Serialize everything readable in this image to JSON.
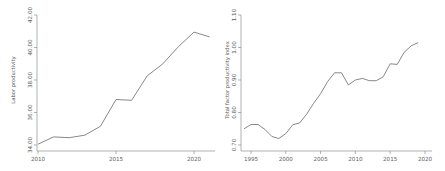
{
  "figure": {
    "background": "#ffffff"
  },
  "chart_data": [
    {
      "type": "line",
      "title": "",
      "xlabel": "",
      "ylabel": "Labor productivity",
      "x": [
        2010,
        2011,
        2012,
        2013,
        2014,
        2015,
        2016,
        2017,
        2018,
        2019,
        2020,
        2021
      ],
      "values": [
        34.05,
        34.5,
        34.45,
        34.6,
        35.15,
        36.8,
        36.75,
        38.25,
        39.0,
        40.05,
        40.95,
        40.65
      ],
      "ytick_values": [
        34,
        36,
        38,
        40,
        42
      ],
      "ytick_labels": [
        "34.00",
        "36.00",
        "38.00",
        "40.00",
        "42.00"
      ],
      "xtick_values": [
        2010,
        2015,
        2020
      ],
      "xtick_labels": [
        "2010",
        "2015",
        "2020"
      ],
      "ylim": [
        33.6,
        42.0
      ],
      "xlim": [
        2010,
        2021.4
      ],
      "grid": false,
      "legend": "none",
      "line_color": "#6a6a6a",
      "axis_color": "#8f8f8f",
      "text_color": "#5e5e5e"
    },
    {
      "type": "line",
      "title": "",
      "xlabel": "",
      "ylabel": "Total factor productivity index",
      "x": [
        1994,
        1995,
        1996,
        1997,
        1998,
        1999,
        2000,
        2001,
        2002,
        2003,
        2004,
        2005,
        2006,
        2007,
        2008,
        2009,
        2010,
        2011,
        2012,
        2013,
        2014,
        2015,
        2016,
        2017,
        2018,
        2019
      ],
      "values": [
        0.75,
        0.763,
        0.763,
        0.748,
        0.726,
        0.72,
        0.735,
        0.762,
        0.768,
        0.795,
        0.828,
        0.858,
        0.895,
        0.922,
        0.922,
        0.885,
        0.9,
        0.905,
        0.898,
        0.898,
        0.91,
        0.95,
        0.948,
        0.985,
        1.005,
        1.015
      ],
      "ytick_values": [
        0.7,
        0.8,
        0.9,
        1.0,
        1.1
      ],
      "ytick_labels": [
        "0.70",
        "0.80",
        "0.90",
        "1.00",
        "1.10"
      ],
      "xtick_values": [
        1995,
        2000,
        2005,
        2010,
        2015,
        2020
      ],
      "xtick_labels": [
        "1995",
        "2000",
        "2005",
        "2010",
        "2015",
        "2020"
      ],
      "ylim": [
        0.68,
        1.1
      ],
      "xlim": [
        1993,
        2021
      ],
      "grid": false,
      "legend": "none",
      "line_color": "#6a6a6a",
      "axis_color": "#8f8f8f",
      "text_color": "#5e5e5e"
    }
  ]
}
